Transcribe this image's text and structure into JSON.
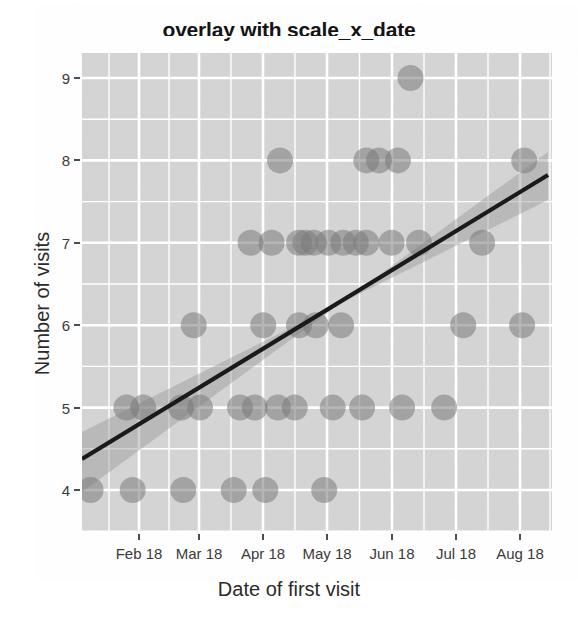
{
  "chart_data": {
    "type": "scatter",
    "title": "overlay with scale_x_date",
    "xlabel": "Date of first visit",
    "ylabel": "Number of visits",
    "x_tick_labels": [
      "Feb 18",
      "Mar 18",
      "Apr 18",
      "May 18",
      "Jun 18",
      "Jul 18",
      "Aug 18"
    ],
    "y_tick_labels": [
      "4",
      "5",
      "6",
      "7",
      "8",
      "9"
    ],
    "y_ticks": [
      4,
      5,
      6,
      7,
      8,
      9
    ],
    "ylim": [
      3.6,
      9.35
    ],
    "xlim": [
      "2018-01-09",
      "2018-08-28"
    ],
    "grid": true,
    "legend": null,
    "panel_background": "#d9d9d9",
    "grid_color": "#ffffff",
    "point_color": "#7a7a7a",
    "point_opacity": 0.55,
    "point_radius_px": 13,
    "fit_line_color": "#1a1a1a",
    "fit_band_color": "#9a9a9a",
    "fit_band_opacity": 0.45,
    "series": [
      {
        "name": "first visits",
        "points": [
          {
            "x": "2018-01-09",
            "y": 4
          },
          {
            "x": "2018-01-29",
            "y": 4
          },
          {
            "x": "2018-02-22",
            "y": 4
          },
          {
            "x": "2018-03-18",
            "y": 4
          },
          {
            "x": "2018-04-02",
            "y": 4
          },
          {
            "x": "2018-05-00",
            "y": 4
          },
          {
            "x": "2018-01-26",
            "y": 5
          },
          {
            "x": "2018-02-03",
            "y": 5
          },
          {
            "x": "2018-02-21",
            "y": 5
          },
          {
            "x": "2018-03-02",
            "y": 5
          },
          {
            "x": "2018-03-21",
            "y": 5
          },
          {
            "x": "2018-03-28",
            "y": 5
          },
          {
            "x": "2018-04-08",
            "y": 5
          },
          {
            "x": "2018-04-16",
            "y": 5
          },
          {
            "x": "2018-05-04",
            "y": 5
          },
          {
            "x": "2018-05-18",
            "y": 5
          },
          {
            "x": "2018-06-06",
            "y": 5
          },
          {
            "x": "2018-06-26",
            "y": 5
          },
          {
            "x": "2018-02-27",
            "y": 6
          },
          {
            "x": "2018-04-01",
            "y": 6
          },
          {
            "x": "2018-04-18",
            "y": 6
          },
          {
            "x": "2018-04-26",
            "y": 6
          },
          {
            "x": "2018-05-08",
            "y": 6
          },
          {
            "x": "2018-07-05",
            "y": 6
          },
          {
            "x": "2018-08-02",
            "y": 6
          },
          {
            "x": "2018-03-26",
            "y": 7
          },
          {
            "x": "2018-04-05",
            "y": 7
          },
          {
            "x": "2018-04-18",
            "y": 7
          },
          {
            "x": "2018-04-21",
            "y": 7
          },
          {
            "x": "2018-04-25",
            "y": 7
          },
          {
            "x": "2018-05-02",
            "y": 7
          },
          {
            "x": "2018-05-09",
            "y": 7
          },
          {
            "x": "2018-05-15",
            "y": 7
          },
          {
            "x": "2018-05-20",
            "y": 7
          },
          {
            "x": "2018-06-01",
            "y": 7
          },
          {
            "x": "2018-06-14",
            "y": 7
          },
          {
            "x": "2018-07-14",
            "y": 7
          },
          {
            "x": "2018-04-09",
            "y": 8
          },
          {
            "x": "2018-05-20",
            "y": 8
          },
          {
            "x": "2018-05-26",
            "y": 8
          },
          {
            "x": "2018-06-04",
            "y": 8
          },
          {
            "x": "2018-08-03",
            "y": 8
          },
          {
            "x": "2018-06-10",
            "y": 9
          }
        ]
      }
    ],
    "fit": {
      "type": "linear",
      "line_start": {
        "x_px": 82,
        "y_px": 459
      },
      "line_end": {
        "x_px": 548,
        "y_px": 175
      },
      "y_start_value": 4.4,
      "y_end_value": 7.88
    }
  }
}
